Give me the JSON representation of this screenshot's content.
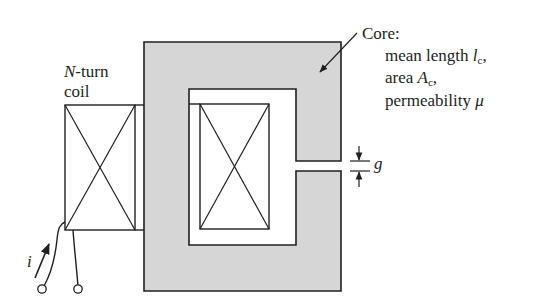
{
  "figure": {
    "type": "magnetic-circuit",
    "colors": {
      "core_fill": "#d6d6d6",
      "stroke": "#231f20",
      "background": "#ffffff"
    }
  },
  "labels": {
    "coil": {
      "n_symbol": "N",
      "n_suffix": "-turn",
      "line2": "coil"
    },
    "core": {
      "title": "Core:",
      "mean_length_text": "mean length ",
      "mean_length_symbol": "l",
      "mean_length_sub": "c",
      "mean_length_punct": ",",
      "area_text": "area ",
      "area_symbol": "A",
      "area_sub": "c",
      "area_punct": ",",
      "permeability_text": "permeability ",
      "permeability_symbol": "μ"
    },
    "gap_symbol": "g",
    "current_symbol": "i"
  }
}
